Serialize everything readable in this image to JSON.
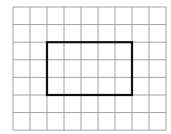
{
  "grid": {
    "columns": 9,
    "rows": 7,
    "origin_x": 13,
    "origin_y": 7,
    "cell_w": 17,
    "cell_h": 17.6,
    "line_color": "#8a8a8a",
    "line_width": 0.8
  },
  "highlight_rectangle": {
    "col_start": 2,
    "col_end": 7,
    "row_start": 2,
    "row_end": 5,
    "width_cells": 5,
    "height_cells": 3,
    "stroke_color": "#111111",
    "stroke_width": 2.2
  }
}
